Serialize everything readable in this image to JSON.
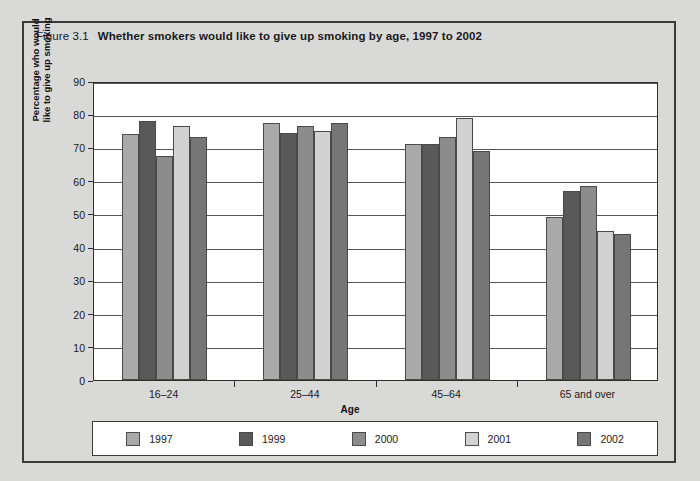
{
  "figure": {
    "number": "Figure 3.1",
    "caption": "Whether smokers would like to give up smoking by age, 1997 to 2002"
  },
  "chart_data": {
    "type": "bar",
    "title": "Whether smokers would like to give up smoking by age, 1997 to 2002",
    "xlabel": "Age",
    "ylabel": "Percentage who would like to give up smoking",
    "ylabel_lines": [
      "Percentage who would",
      "like to give up smoking"
    ],
    "categories": [
      "16–24",
      "25–44",
      "45–64",
      "65 and over"
    ],
    "series": [
      {
        "name": "1997",
        "color": "#a9a9a9",
        "values": [
          74,
          77.5,
          71,
          49
        ]
      },
      {
        "name": "1999",
        "color": "#595959",
        "values": [
          78,
          74.5,
          71,
          57
        ]
      },
      {
        "name": "2000",
        "color": "#8c8c8c",
        "values": [
          67.5,
          76.5,
          73,
          58.5
        ]
      },
      {
        "name": "2001",
        "color": "#d2d2d2",
        "values": [
          76.5,
          75,
          79,
          45
        ]
      },
      {
        "name": "2002",
        "color": "#767676",
        "values": [
          73,
          77.5,
          69,
          44
        ]
      }
    ],
    "ylim": [
      0,
      90
    ],
    "yticks": [
      0,
      10,
      20,
      30,
      40,
      50,
      60,
      70,
      80,
      90
    ],
    "ytick_labels": [
      "0",
      "10",
      "20",
      "30",
      "40",
      "50",
      "60",
      "70",
      "80",
      "90"
    ],
    "grid": true,
    "legend_position": "bottom"
  },
  "colors": {
    "page_background": "#d9d9d7",
    "frame": "#3a3a3a",
    "plot_background": "#ffffff",
    "gridline": "#555555"
  }
}
